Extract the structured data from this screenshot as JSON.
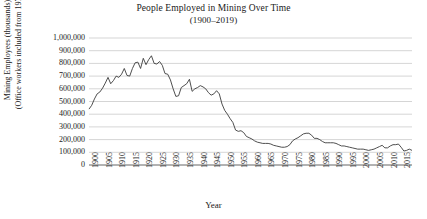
{
  "chart_data": {
    "type": "line",
    "title": "People Employed in Mining Over Time",
    "subtitle": "(1900–2019)",
    "xlabel": "Year",
    "ylabel_line1": "Mining Employees (thousands)",
    "ylabel_line2": "(Office workers included from 1973)",
    "xlim": [
      1900,
      2019
    ],
    "ylim": [
      0,
      1000000
    ],
    "grid": true,
    "legend": "none",
    "ytick_labels": [
      "1,000,000",
      "900,000",
      "800,000",
      "700,000",
      "600,000",
      "500,000",
      "400,000",
      "300,000",
      "200,000",
      "100,000",
      "0"
    ],
    "ytick_values": [
      1000000,
      900000,
      800000,
      700000,
      600000,
      500000,
      400000,
      300000,
      200000,
      100000,
      0
    ],
    "xtick_labels": [
      "1900",
      "1905",
      "1910",
      "1915",
      "1920",
      "1925",
      "1930",
      "1935",
      "1940",
      "1945",
      "1950",
      "1955",
      "1960",
      "1965",
      "1970",
      "1975",
      "1980",
      "1985",
      "1990",
      "1995",
      "2000",
      "2005",
      "2010",
      "2015"
    ],
    "xtick_values": [
      1900,
      1905,
      1910,
      1915,
      1920,
      1925,
      1930,
      1935,
      1940,
      1945,
      1950,
      1955,
      1960,
      1965,
      1970,
      1975,
      1980,
      1985,
      1990,
      1995,
      2000,
      2005,
      2010,
      2015
    ],
    "line_color": "#3b3b3b",
    "grid_color": "#b9b9b9",
    "axis_color": "#555555",
    "series": [
      {
        "name": "Mining Employees",
        "x": [
          1900,
          1901,
          1902,
          1903,
          1904,
          1905,
          1906,
          1907,
          1908,
          1909,
          1910,
          1911,
          1912,
          1913,
          1914,
          1915,
          1916,
          1917,
          1918,
          1919,
          1920,
          1921,
          1922,
          1923,
          1924,
          1925,
          1926,
          1927,
          1928,
          1929,
          1930,
          1931,
          1932,
          1933,
          1934,
          1935,
          1936,
          1937,
          1938,
          1939,
          1940,
          1941,
          1942,
          1943,
          1944,
          1945,
          1946,
          1947,
          1948,
          1949,
          1950,
          1951,
          1952,
          1953,
          1954,
          1955,
          1956,
          1957,
          1958,
          1959,
          1960,
          1961,
          1962,
          1963,
          1964,
          1965,
          1966,
          1967,
          1968,
          1969,
          1970,
          1971,
          1972,
          1973,
          1974,
          1975,
          1976,
          1977,
          1978,
          1979,
          1980,
          1981,
          1982,
          1983,
          1984,
          1985,
          1986,
          1987,
          1988,
          1989,
          1990,
          1991,
          1992,
          1993,
          1994,
          1995,
          1996,
          1997,
          1998,
          1999,
          2000,
          2001,
          2002,
          2003,
          2004,
          2005,
          2006,
          2007,
          2008,
          2009,
          2010,
          2011,
          2012,
          2013,
          2014,
          2015,
          2016,
          2017,
          2018,
          2019
        ],
        "values": [
          440000,
          470000,
          520000,
          560000,
          575000,
          605000,
          645000,
          690000,
          640000,
          665000,
          700000,
          690000,
          715000,
          760000,
          705000,
          700000,
          760000,
          805000,
          810000,
          760000,
          840000,
          790000,
          830000,
          860000,
          800000,
          795000,
          815000,
          785000,
          720000,
          715000,
          670000,
          600000,
          540000,
          545000,
          610000,
          625000,
          640000,
          675000,
          580000,
          600000,
          610000,
          625000,
          615000,
          600000,
          570000,
          550000,
          560000,
          585000,
          560000,
          480000,
          430000,
          400000,
          365000,
          335000,
          275000,
          265000,
          270000,
          255000,
          225000,
          215000,
          205000,
          190000,
          180000,
          175000,
          170000,
          170000,
          170000,
          165000,
          155000,
          150000,
          145000,
          140000,
          140000,
          145000,
          160000,
          190000,
          205000,
          215000,
          230000,
          245000,
          250000,
          250000,
          235000,
          210000,
          210000,
          200000,
          185000,
          175000,
          175000,
          175000,
          175000,
          170000,
          160000,
          150000,
          150000,
          145000,
          140000,
          135000,
          130000,
          125000,
          125000,
          125000,
          120000,
          115000,
          120000,
          125000,
          135000,
          145000,
          155000,
          135000,
          135000,
          150000,
          160000,
          160000,
          165000,
          140000,
          110000,
          115000,
          125000,
          115000
        ]
      }
    ]
  }
}
